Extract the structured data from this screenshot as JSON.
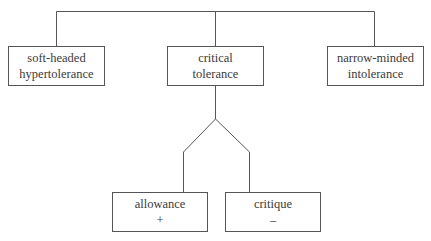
{
  "diagram": {
    "type": "tree",
    "line_color": "#555555",
    "top_row": [
      {
        "id": "soft-headed-hypertolerance",
        "lines": [
          "soft-headed",
          "hypertolerance"
        ]
      },
      {
        "id": "critical-tolerance",
        "lines": [
          "critical",
          "tolerance"
        ]
      },
      {
        "id": "narrow-minded-intolerance",
        "lines": [
          "narrow-minded",
          "intolerance"
        ]
      }
    ],
    "children_of_critical_tolerance": [
      {
        "id": "allowance",
        "lines": [
          "allowance",
          "+"
        ]
      },
      {
        "id": "critique",
        "lines": [
          "critique",
          "–"
        ]
      }
    ]
  }
}
